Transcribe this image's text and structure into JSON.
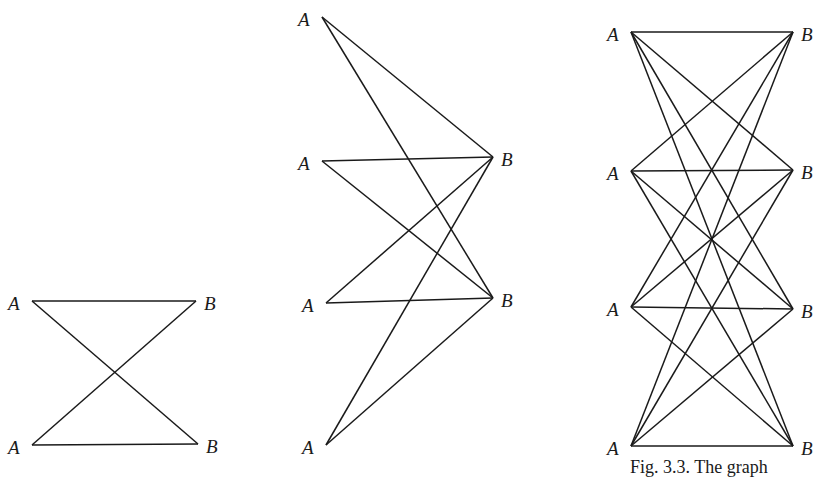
{
  "figure": {
    "caption_partial": "Fig. 3.3.   The graph",
    "stroke_color": "#1a1a1a",
    "background": "#ffffff"
  },
  "graphs": [
    {
      "name": "K2,2",
      "left_label": "A",
      "right_label": "B",
      "left_nodes": [
        [
          28,
          301
        ],
        [
          28,
          445
        ]
      ],
      "right_nodes": [
        [
          200,
          301
        ],
        [
          202,
          444
        ]
      ]
    },
    {
      "name": "K4,2",
      "left_label": "A",
      "right_label": "B",
      "left_nodes": [
        [
          318,
          17
        ],
        [
          318,
          161
        ],
        [
          322,
          303
        ],
        [
          322,
          445
        ]
      ],
      "right_nodes": [
        [
          497,
          157
        ],
        [
          497,
          298
        ]
      ]
    },
    {
      "name": "K4,4",
      "left_label": "A",
      "right_label": "B",
      "left_nodes": [
        [
          627,
          32
        ],
        [
          627,
          171
        ],
        [
          627,
          307
        ],
        [
          627,
          446
        ]
      ],
      "right_nodes": [
        [
          797,
          32
        ],
        [
          797,
          170
        ],
        [
          797,
          309
        ],
        [
          797,
          446
        ]
      ]
    }
  ]
}
